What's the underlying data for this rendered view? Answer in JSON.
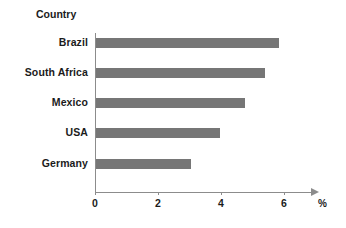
{
  "chart_data": {
    "type": "bar",
    "orientation": "horizontal",
    "title": "",
    "axis_title": "Country",
    "xlabel": "%",
    "ylabel": "Country",
    "categories": [
      "Brazil",
      "South Africa",
      "Mexico",
      "USA",
      "Germany"
    ],
    "values": [
      5.75,
      5.3,
      4.7,
      3.9,
      3.0
    ],
    "xlim": [
      0,
      7
    ],
    "xticks": [
      0,
      2,
      4,
      6
    ],
    "xtick_labels": [
      "0",
      "2",
      "4",
      "6"
    ],
    "grid": false,
    "legend": false,
    "bar_color": "#767676",
    "axis_color": "#8c8c8c",
    "text_color": "#1b1b1b"
  },
  "labels": {
    "axis_title": "Country",
    "unit": "%",
    "categories": [
      {
        "name": "Brazil",
        "value": 5.75
      },
      {
        "name": "South Africa",
        "value": 5.3
      },
      {
        "name": "Mexico",
        "value": 4.7
      },
      {
        "name": "USA",
        "value": 3.9
      },
      {
        "name": "Germany",
        "value": 3.0
      }
    ],
    "xticks": [
      "0",
      "2",
      "4",
      "6"
    ]
  }
}
